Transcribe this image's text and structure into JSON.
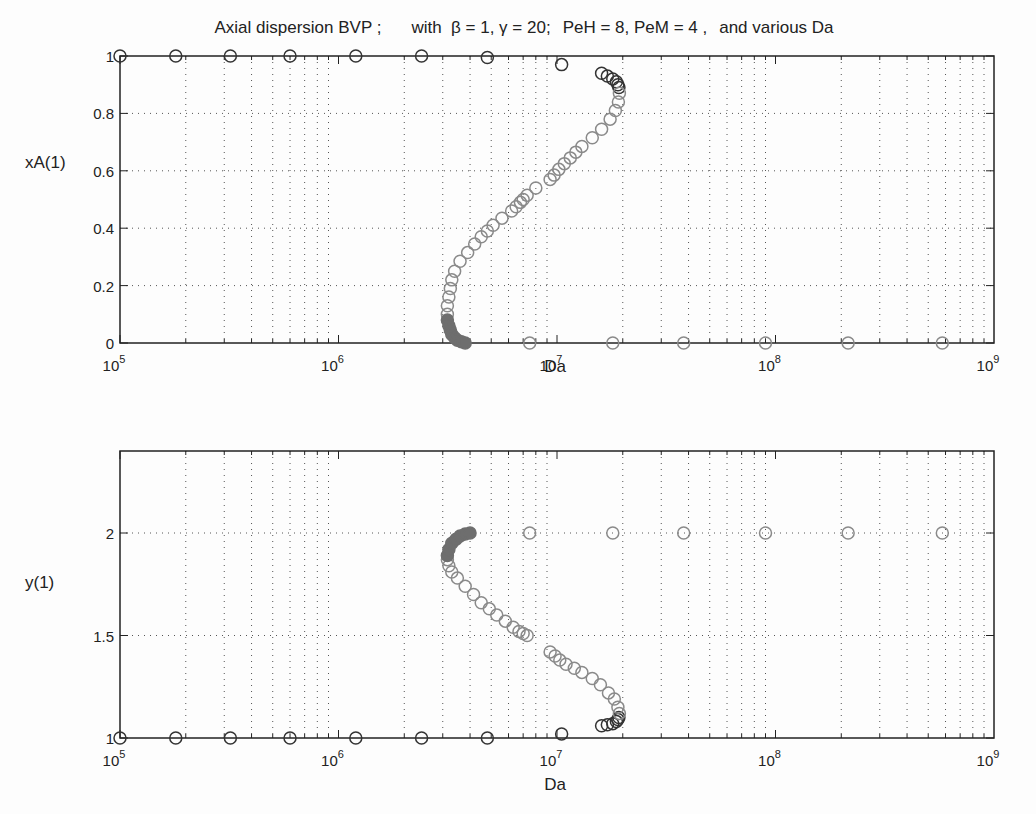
{
  "figure": {
    "title_parts": [
      "Axial dispersion BVP ;",
      "with  β = 1, γ = 20;",
      "PeH = 8, PeM = 4 ,",
      "and various Da"
    ]
  },
  "chart_data": [
    {
      "type": "scatter",
      "title": "Axial dispersion BVP ;  with β = 1, γ = 20;  PeH = 8, PeM = 4 ,  and various Da",
      "xlabel": "Da",
      "ylabel": "xA(1)",
      "xscale": "log",
      "xlim": [
        100000,
        1000000000
      ],
      "ylim": [
        0,
        1
      ],
      "xticks": [
        "10^5",
        "10^6",
        "10^7",
        "10^8",
        "10^9"
      ],
      "yticks": [
        "0",
        "0.2",
        "0.4",
        "0.6",
        "0.8",
        "1"
      ],
      "grid": true,
      "marker": "o",
      "series": [
        {
          "name": "upper branch (dark)",
          "color": "#333333",
          "points": [
            [
              100000,
              1.0
            ],
            [
              180000,
              1.0
            ],
            [
              320000,
              1.0
            ],
            [
              600000,
              1.0
            ],
            [
              1200000,
              1.0
            ],
            [
              2400000,
              1.0
            ],
            [
              4800000,
              0.995
            ],
            [
              10500000,
              0.97
            ],
            [
              16000000,
              0.94
            ],
            [
              17000000,
              0.93
            ],
            [
              18000000,
              0.92
            ],
            [
              18700000,
              0.91
            ],
            [
              19000000,
              0.9
            ],
            [
              19200000,
              0.89
            ]
          ]
        },
        {
          "name": "middle branch (light)",
          "color": "#8a8a8a",
          "points": [
            [
              19300000,
              0.87
            ],
            [
              19100000,
              0.84
            ],
            [
              18500000,
              0.81
            ],
            [
              17500000,
              0.78
            ],
            [
              16000000,
              0.745
            ],
            [
              14500000,
              0.715
            ],
            [
              13000000,
              0.685
            ],
            [
              12200000,
              0.665
            ],
            [
              11500000,
              0.645
            ],
            [
              10800000,
              0.625
            ],
            [
              10200000,
              0.605
            ],
            [
              9700000,
              0.585
            ],
            [
              9300000,
              0.57
            ],
            [
              8000000,
              0.54
            ],
            [
              7300000,
              0.515
            ],
            [
              7000000,
              0.5
            ],
            [
              6800000,
              0.49
            ],
            [
              6500000,
              0.475
            ],
            [
              6200000,
              0.46
            ],
            [
              5600000,
              0.435
            ],
            [
              5100000,
              0.41
            ],
            [
              4800000,
              0.39
            ],
            [
              4500000,
              0.37
            ],
            [
              4200000,
              0.345
            ],
            [
              3900000,
              0.315
            ],
            [
              3600000,
              0.285
            ],
            [
              3400000,
              0.25
            ],
            [
              3300000,
              0.22
            ],
            [
              3250000,
              0.19
            ],
            [
              3200000,
              0.16
            ],
            [
              3150000,
              0.13
            ],
            [
              3150000,
              0.1
            ]
          ]
        },
        {
          "name": "lower branch (filled)",
          "color": "#6e6e6e",
          "points": [
            [
              3150000,
              0.08
            ],
            [
              3200000,
              0.06
            ],
            [
              3250000,
              0.045
            ],
            [
              3300000,
              0.03
            ],
            [
              3400000,
              0.018
            ],
            [
              3500000,
              0.01
            ],
            [
              3650000,
              0.004
            ],
            [
              3800000,
              0.0
            ]
          ]
        },
        {
          "name": "low-conversion points",
          "color": "#8a8a8a",
          "points": [
            [
              7500000,
              0.0
            ],
            [
              18000000,
              0.0
            ],
            [
              38000000,
              0.0
            ],
            [
              90000000,
              0.0
            ],
            [
              215000000,
              0.0
            ],
            [
              580000000,
              0.0
            ]
          ]
        }
      ]
    },
    {
      "type": "scatter",
      "xlabel": "Da",
      "ylabel": "y(1)",
      "xscale": "log",
      "xlim": [
        100000,
        1000000000
      ],
      "ylim": [
        1,
        2.4
      ],
      "xticks": [
        "10^5",
        "10^6",
        "10^7",
        "10^8",
        "10^9"
      ],
      "yticks": [
        "1",
        "1.5",
        "2"
      ],
      "grid": true,
      "marker": "o",
      "series": [
        {
          "name": "low-temperature branch (dark)",
          "color": "#333333",
          "points": [
            [
              100000,
              1.0
            ],
            [
              180000,
              1.0
            ],
            [
              320000,
              1.0
            ],
            [
              600000,
              1.0
            ],
            [
              1200000,
              1.0
            ],
            [
              2400000,
              1.0
            ],
            [
              4800000,
              1.0
            ],
            [
              10500000,
              1.02
            ],
            [
              16000000,
              1.06
            ],
            [
              17000000,
              1.065
            ],
            [
              18000000,
              1.07
            ],
            [
              18700000,
              1.08
            ],
            [
              19000000,
              1.09
            ],
            [
              19200000,
              1.1
            ]
          ]
        },
        {
          "name": "middle branch (light)",
          "color": "#8a8a8a",
          "points": [
            [
              19300000,
              1.12
            ],
            [
              19000000,
              1.15
            ],
            [
              18300000,
              1.19
            ],
            [
              17200000,
              1.22
            ],
            [
              15800000,
              1.26
            ],
            [
              14500000,
              1.29
            ],
            [
              13000000,
              1.32
            ],
            [
              12000000,
              1.34
            ],
            [
              11000000,
              1.36
            ],
            [
              10300000,
              1.38
            ],
            [
              9800000,
              1.4
            ],
            [
              9300000,
              1.42
            ],
            [
              7300000,
              1.5
            ],
            [
              7000000,
              1.51
            ],
            [
              6700000,
              1.52
            ],
            [
              6300000,
              1.54
            ],
            [
              5800000,
              1.57
            ],
            [
              5300000,
              1.6
            ],
            [
              4900000,
              1.63
            ],
            [
              4500000,
              1.66
            ],
            [
              4150000,
              1.7
            ],
            [
              3800000,
              1.74
            ],
            [
              3500000,
              1.78
            ],
            [
              3300000,
              1.81
            ],
            [
              3200000,
              1.84
            ],
            [
              3150000,
              1.87
            ]
          ]
        },
        {
          "name": "high-temperature branch (filled)",
          "color": "#6e6e6e",
          "points": [
            [
              3150000,
              1.89
            ],
            [
              3200000,
              1.92
            ],
            [
              3300000,
              1.95
            ],
            [
              3450000,
              1.97
            ],
            [
              3600000,
              1.985
            ],
            [
              3800000,
              1.995
            ],
            [
              4000000,
              2.0
            ]
          ]
        },
        {
          "name": "ignited points",
          "color": "#8a8a8a",
          "points": [
            [
              7500000,
              2.0
            ],
            [
              18000000,
              2.0
            ],
            [
              38000000,
              2.0
            ],
            [
              90000000,
              2.0
            ],
            [
              215000000,
              2.0
            ],
            [
              580000000,
              2.0
            ]
          ]
        }
      ]
    }
  ]
}
